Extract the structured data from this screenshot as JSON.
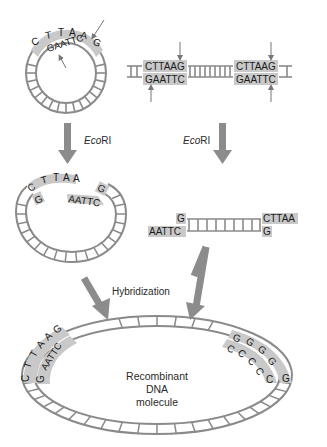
{
  "colors": {
    "strand": "#8a8a8a",
    "highlight": "#c9c9c9",
    "arrow": "#8c8c8c",
    "text": "#2a2a2a"
  },
  "plasmid": {
    "top_strand": "CTTAAG",
    "bottom_strand": "GAATTC",
    "top_letters": [
      "C",
      "T",
      "T",
      "A",
      "A",
      "G"
    ]
  },
  "linear_dna": {
    "site_left": {
      "top": "CTTAAG",
      "bottom": "GAATTC"
    },
    "site_right": {
      "top": "CTTAAG",
      "bottom": "GAATTC"
    }
  },
  "steps": {
    "enzyme_left": {
      "prefix": "Eco",
      "suffix": "RI"
    },
    "enzyme_right": {
      "prefix": "Eco",
      "suffix": "RI"
    },
    "hybridization": "Hybridization"
  },
  "cut_plasmid": {
    "top_left": "CTTAA",
    "bottom_left": "G",
    "bottom_right": "AATTC",
    "top_right": "G"
  },
  "fragment": {
    "left_top": "G",
    "left_bottom": "AATTC",
    "right_top": "CTTAA",
    "right_bottom": "G"
  },
  "recombinant": {
    "left_outer": "CTTAAG",
    "left_inner": "GAATTC",
    "right_outer": "GGGGG",
    "right_inner": "CCCCC",
    "label_line1": "Recombinant",
    "label_line2": "DNA",
    "label_line3": "molecule"
  }
}
